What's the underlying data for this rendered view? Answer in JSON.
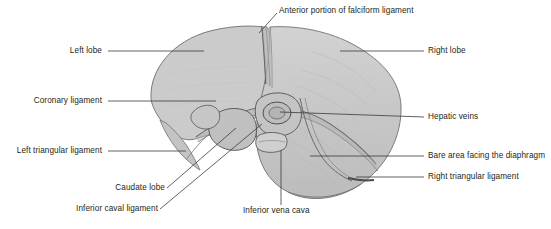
{
  "figure": {
    "background_color": "#ffffff",
    "organ_fill_color": "#c9c9c9",
    "organ_outline_color": "#6b6b6b",
    "leader_line_color": "#3a3a3a",
    "label_text_color": "#231f20"
  },
  "labels": {
    "anterior_falciform": "Anterior portion of falciform ligament",
    "left_lobe": "Left lobe",
    "right_lobe": "Right lobe",
    "coronary_ligament": "Coronary ligament",
    "hepatic_veins": "Hepatic veins",
    "left_triangular_ligament": "Left triangular ligament",
    "bare_area": "Bare area facing the diaphragm",
    "right_triangular_ligament": "Right triangular ligament",
    "caudate_lobe": "Caudate lobe",
    "inferior_caval_ligament": "Inferior caval ligament",
    "inferior_vena_cava": "Inferior vena cava"
  }
}
